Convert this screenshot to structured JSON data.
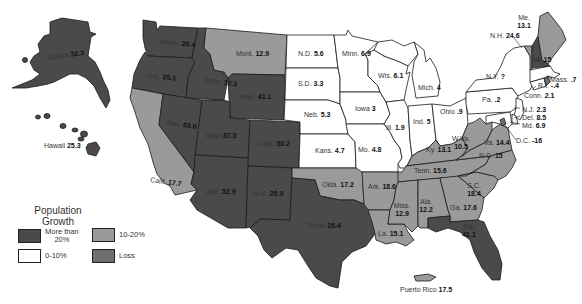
{
  "legend": {
    "title_line1": "Population",
    "title_line2": "Growth",
    "items": [
      {
        "key": "high",
        "label_line1": "More than",
        "label_line2": "20%",
        "color": "#4a4a4a"
      },
      {
        "key": "mid",
        "label_line1": "10-20%",
        "label_line2": "",
        "color": "#9a9a9a"
      },
      {
        "key": "low",
        "label_line1": "0-10%",
        "label_line2": "",
        "color": "#ffffff"
      },
      {
        "key": "loss",
        "label_line1": "Loss",
        "label_line2": "",
        "color": "#6e6e6e"
      }
    ]
  },
  "colors": {
    "high": "#4a4a4a",
    "mid": "#9a9a9a",
    "low": "#ffffff",
    "loss": "#6e6e6e",
    "border": "#1a1a1a"
  },
  "states": [
    {
      "id": "alaska",
      "name": "Alaska",
      "value": "32.3",
      "cat": "high"
    },
    {
      "id": "hawaii",
      "name": "Hawaii",
      "value": "25.3",
      "cat": "high"
    },
    {
      "id": "washington",
      "name": "Wash.",
      "value": "20.4",
      "cat": "high"
    },
    {
      "id": "oregon",
      "name": "Ore.",
      "value": "25.1",
      "cat": "high"
    },
    {
      "id": "california",
      "name": "Calif.",
      "value": "17.7",
      "cat": "mid"
    },
    {
      "id": "idaho",
      "name": "Idaho",
      "value": "32.3",
      "cat": "high"
    },
    {
      "id": "nevada",
      "name": "Nev.",
      "value": "63.8",
      "cat": "high"
    },
    {
      "id": "montana",
      "name": "Mont.",
      "value": "12.9",
      "cat": "mid"
    },
    {
      "id": "wyoming",
      "name": "Wyo.",
      "value": "41.1",
      "cat": "high"
    },
    {
      "id": "utah",
      "name": "Utah",
      "value": "37.3",
      "cat": "high"
    },
    {
      "id": "colorado",
      "name": "Colo.",
      "value": "30.2",
      "cat": "high"
    },
    {
      "id": "arizona",
      "name": "Ariz.",
      "value": "52.9",
      "cat": "high"
    },
    {
      "id": "new-mexico",
      "name": "N.M.",
      "value": "26.9",
      "cat": "high"
    },
    {
      "id": "north-dakota",
      "name": "N.D.",
      "value": "5.6",
      "cat": "low"
    },
    {
      "id": "south-dakota",
      "name": "S.D.",
      "value": "3.3",
      "cat": "low"
    },
    {
      "id": "nebraska",
      "name": "Neb.",
      "value": "5.3",
      "cat": "low"
    },
    {
      "id": "kansas",
      "name": "Kans.",
      "value": "4.7",
      "cat": "low"
    },
    {
      "id": "oklahoma",
      "name": "Okla.",
      "value": "17.2",
      "cat": "mid"
    },
    {
      "id": "texas",
      "name": "Texas",
      "value": "26.4",
      "cat": "high"
    },
    {
      "id": "minnesota",
      "name": "Minn.",
      "value": "6.9",
      "cat": "low"
    },
    {
      "id": "iowa",
      "name": "Iowa",
      "value": "3",
      "cat": "low"
    },
    {
      "id": "missouri",
      "name": "Mo.",
      "value": "4.8",
      "cat": "low"
    },
    {
      "id": "arkansas",
      "name": "Ark.",
      "value": "18.6",
      "cat": "mid"
    },
    {
      "id": "louisiana",
      "name": "La.",
      "value": "15.1",
      "cat": "mid"
    },
    {
      "id": "wisconsin",
      "name": "Wis.",
      "value": "6.1",
      "cat": "low"
    },
    {
      "id": "illinois",
      "name": "Ill.",
      "value": "1.9",
      "cat": "low"
    },
    {
      "id": "michigan",
      "name": "Mich.",
      "value": "4",
      "cat": "low"
    },
    {
      "id": "indiana",
      "name": "Ind.",
      "value": "5",
      "cat": "low"
    },
    {
      "id": "ohio",
      "name": "Ohio",
      "value": ".9",
      "cat": "low"
    },
    {
      "id": "kentucky",
      "name": "Ky.",
      "value": "13.1",
      "cat": "mid"
    },
    {
      "id": "tennessee",
      "name": "Tenn.",
      "value": "15.6",
      "cat": "mid"
    },
    {
      "id": "mississippi",
      "name": "Miss.",
      "value": "12.9",
      "cat": "mid"
    },
    {
      "id": "alabama",
      "name": "Ala.",
      "value": "12.2",
      "cat": "mid"
    },
    {
      "id": "georgia",
      "name": "Ga.",
      "value": "17.6",
      "cat": "mid"
    },
    {
      "id": "florida",
      "name": "Fla.",
      "value": "41.1",
      "cat": "high"
    },
    {
      "id": "south-carolina",
      "name": "S.C.",
      "value": "18.4",
      "cat": "mid"
    },
    {
      "id": "north-carolina",
      "name": "N.C.",
      "value": "15",
      "cat": "mid"
    },
    {
      "id": "virginia",
      "name": "Va.",
      "value": "14.4",
      "cat": "mid"
    },
    {
      "id": "west-virginia",
      "name": "W.Va.",
      "value": "10.5",
      "cat": "mid"
    },
    {
      "id": "pennsylvania",
      "name": "Pa.",
      "value": ".2",
      "cat": "low"
    },
    {
      "id": "new-york",
      "name": "N.Y.",
      "value": "?",
      "cat": "low"
    },
    {
      "id": "new-jersey",
      "name": "N.J.",
      "value": "2.3",
      "cat": "low"
    },
    {
      "id": "delaware",
      "name": "Del.",
      "value": "8.5",
      "cat": "low"
    },
    {
      "id": "maryland",
      "name": "Md.",
      "value": "6.9",
      "cat": "low"
    },
    {
      "id": "dc",
      "name": "D.C.",
      "value": "-16",
      "cat": "loss"
    },
    {
      "id": "connecticut",
      "name": "Conn.",
      "value": "2.1",
      "cat": "low"
    },
    {
      "id": "rhode-island",
      "name": "R.I.",
      "value": "-.4",
      "cat": "loss"
    },
    {
      "id": "massachusetts",
      "name": "Mass.",
      "value": ".7",
      "cat": "low"
    },
    {
      "id": "vermont",
      "name": "Vt.",
      "value": "15",
      "cat": "mid"
    },
    {
      "id": "new-hampshire",
      "name": "N.H.",
      "value": "24.6",
      "cat": "high"
    },
    {
      "id": "maine",
      "name": "Me.",
      "value": "13.1",
      "cat": "mid"
    },
    {
      "id": "puerto-rico",
      "name": "Puerto Rico",
      "value": "17.5",
      "cat": "mid"
    }
  ]
}
